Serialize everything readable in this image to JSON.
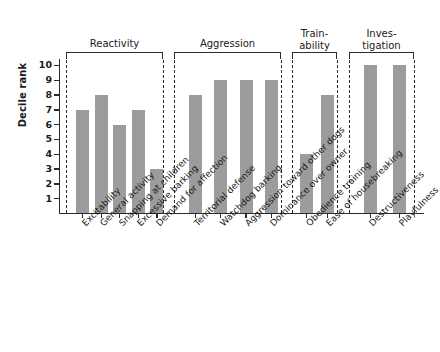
{
  "chart_data": {
    "type": "bar",
    "title": "",
    "xlabel": "",
    "ylabel": "Decile rank",
    "ylim": [
      0,
      10.4
    ],
    "ytick_labels": [
      "1",
      "2",
      "3",
      "4",
      "5",
      "6",
      "7",
      "8",
      "9",
      "10"
    ],
    "ytick_values": [
      1,
      2,
      3,
      4,
      5,
      6,
      7,
      8,
      9,
      10
    ],
    "grid": false,
    "legend": "none",
    "bar_color": "#9c9c9c",
    "axis_color": "#2b2b2b",
    "background_color": "#ffffff",
    "categories": [
      "Excitability",
      "General activity",
      "Snapping at children",
      "Excessive barking",
      "Demand for affection",
      "Territorial defense",
      "Watchdog barking",
      "Aggression toward other dogs",
      "Dominance over owner",
      "Obedience training",
      "Ease of housebreaking",
      "Destructiveness",
      "Playfulness"
    ],
    "values": [
      7,
      8,
      6,
      7,
      3,
      8,
      9,
      9,
      9,
      4,
      8,
      10,
      10
    ],
    "groups": [
      {
        "label": "Reactivity",
        "label_lines": "Reactivity",
        "categories": [
          "Excitability",
          "General activity",
          "Snapping at children",
          "Excessive barking",
          "Demand for affection"
        ],
        "values": [
          7,
          8,
          6,
          7,
          3
        ]
      },
      {
        "label": "Aggression",
        "label_lines": "Aggression",
        "categories": [
          "Territorial defense",
          "Watchdog barking",
          "Aggression toward other dogs",
          "Dominance over owner"
        ],
        "values": [
          8,
          9,
          9,
          9
        ]
      },
      {
        "label": "Train-ability",
        "label_lines": "Train-\nability",
        "categories": [
          "Obedience training",
          "Ease of housebreaking"
        ],
        "values": [
          4,
          8
        ]
      },
      {
        "label": "Investigation",
        "label_lines": "Inves-\ntigation",
        "categories": [
          "Destructiveness",
          "Playfulness"
        ],
        "values": [
          10,
          10
        ]
      }
    ]
  }
}
